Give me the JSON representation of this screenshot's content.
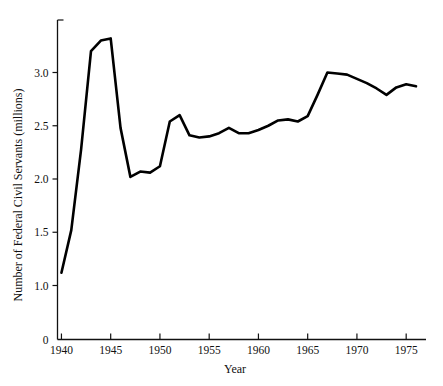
{
  "chart_data": {
    "type": "line",
    "title": "",
    "xlabel": "Year",
    "ylabel": "Number of Federal Civil Servants (millions)",
    "xlim": [
      1939.6,
      1976.2
    ],
    "ylim": [
      0,
      3.55
    ],
    "grid": false,
    "legend": null,
    "xticks": [
      1940,
      1945,
      1950,
      1955,
      1960,
      1965,
      1970,
      1975
    ],
    "xticklabels": [
      "1940",
      "1945",
      "1950",
      "1955",
      "1960",
      "1965",
      "1970",
      "1975"
    ],
    "yticks": [
      0,
      1.0,
      1.5,
      2.0,
      2.5,
      3.0
    ],
    "yticklabels": [
      "0",
      "1.0",
      "1.5",
      "2.0",
      "2.5",
      "3.0"
    ],
    "y_axis_break_note": "axis jumps from 0 to 1.0",
    "series": [
      {
        "name": "Federal civil servants",
        "x": [
          1940,
          1941,
          1942,
          1943,
          1944,
          1945,
          1946,
          1947,
          1948,
          1949,
          1950,
          1951,
          1952,
          1953,
          1954,
          1955,
          1956,
          1957,
          1958,
          1959,
          1960,
          1961,
          1962,
          1963,
          1964,
          1965,
          1966,
          1967,
          1968,
          1969,
          1970,
          1971,
          1972,
          1973,
          1974,
          1975,
          1976
        ],
        "values": [
          1.12,
          1.52,
          2.28,
          3.2,
          3.3,
          3.32,
          2.48,
          2.02,
          2.07,
          2.06,
          2.12,
          2.54,
          2.6,
          2.41,
          2.39,
          2.4,
          2.43,
          2.48,
          2.43,
          2.43,
          2.46,
          2.5,
          2.55,
          2.56,
          2.54,
          2.59,
          2.79,
          3.0,
          2.99,
          2.98,
          2.94,
          2.9,
          2.85,
          2.79,
          2.86,
          2.89,
          2.87
        ]
      }
    ]
  },
  "axis_titles": {
    "x": "Year",
    "y": "Number of Federal Civil Servants (millions)"
  }
}
